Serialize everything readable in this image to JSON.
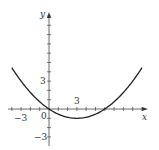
{
  "chart_data": {
    "type": "line",
    "title": "",
    "xlabel": "x",
    "ylabel": "y",
    "xlim": [
      -4,
      10.5
    ],
    "ylim": [
      -4,
      10.3
    ],
    "grid": false,
    "tick_spacing": 1,
    "x_tick_labels": [
      {
        "value": -3,
        "label": "−3"
      },
      {
        "value": 0,
        "label": "0"
      },
      {
        "value": 3,
        "label": "3"
      }
    ],
    "y_tick_labels": [
      {
        "value": 3,
        "label": "3"
      },
      {
        "value": -3,
        "label": "−3"
      }
    ],
    "series": [
      {
        "name": "parabola",
        "equation": "y = (x - 3)^2 / 9 - 1",
        "x": [
          -4,
          -3,
          -2,
          -1,
          0,
          1,
          2,
          3,
          4,
          5,
          6,
          7,
          8,
          9,
          10
        ],
        "y": [
          4.44,
          3.0,
          1.78,
          0.78,
          0.0,
          -0.56,
          -0.89,
          -1.0,
          -0.89,
          -0.56,
          0.0,
          0.78,
          1.78,
          3.0,
          4.44
        ]
      }
    ],
    "color": "#222222"
  },
  "labels": {
    "x_axis": "x",
    "y_axis": "y",
    "origin": "0",
    "x_pos3": "3",
    "x_neg3": "−3",
    "y_pos3": "3",
    "y_neg3": "−3"
  }
}
